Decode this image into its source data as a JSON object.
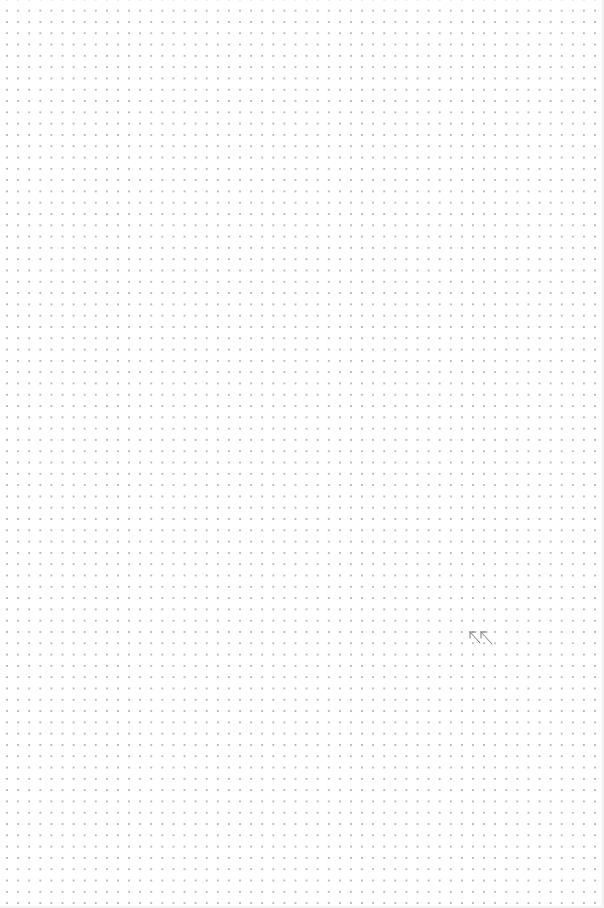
{
  "canvas": {
    "background": "#ffffff",
    "grid_style": "dot-grid",
    "dot_color": "#b9b9b9",
    "dot_spacing_px": 11
  },
  "cursor": {
    "icon": "double-arrow-up-left-icon",
    "color": "#777777"
  }
}
